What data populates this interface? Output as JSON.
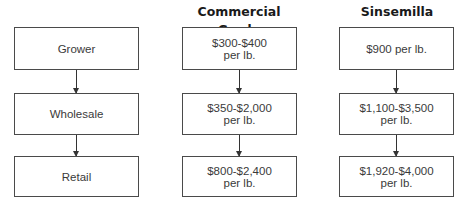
{
  "headings": {
    "commercial": "Commercial Grade",
    "sinsemilla": "Sinsemilla"
  },
  "stages": [
    {
      "label": "Grower"
    },
    {
      "label": "Wholesale"
    },
    {
      "label": "Retail"
    }
  ],
  "commercial": [
    {
      "price": "$300-$400",
      "unit": "per lb."
    },
    {
      "price": "$350-$2,000",
      "unit": "per lb."
    },
    {
      "price": "$800-$2,400",
      "unit": "per lb."
    }
  ],
  "sinsemilla": [
    {
      "price": "$900 per lb.",
      "unit": ""
    },
    {
      "price": "$1,100-$3,500",
      "unit": "per lb."
    },
    {
      "price": "$1,920-$4,000",
      "unit": "per lb."
    }
  ]
}
